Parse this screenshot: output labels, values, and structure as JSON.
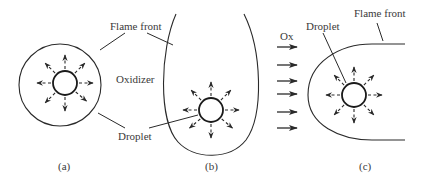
{
  "diagram": {
    "colors": {
      "stroke": "#2a2a2a",
      "text": "#3a3a3a",
      "background": "#ffffff"
    },
    "panels": [
      {
        "id": "a",
        "caption": "(a)",
        "description": "Spherical flame front surrounding droplet in quiescent oxidizer",
        "labels": {
          "flame_front": "Flame front",
          "oxidizer": "Oxidizer",
          "droplet": "Droplet"
        }
      },
      {
        "id": "b",
        "caption": "(b)",
        "description": "Elongated open flame front around droplet",
        "labels": {
          "flame_front": "Flame front",
          "droplet": "Droplet"
        }
      },
      {
        "id": "c",
        "caption": "(c)",
        "description": "Envelope flame around droplet in oxidizer flow",
        "labels": {
          "flame_front": "Flame front",
          "droplet": "Droplet",
          "oxidizer_flow": "Ox"
        },
        "flow_arrow_count": 6
      }
    ],
    "shared_labels": {
      "flame_front": "Flame front",
      "oxidizer": "Oxidizer",
      "droplet": "Droplet"
    }
  }
}
